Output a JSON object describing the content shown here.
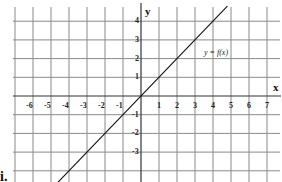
{
  "chart_data": {
    "type": "line",
    "title": "",
    "xlabel": "x",
    "ylabel": "y",
    "xlim": [
      -7,
      7
    ],
    "ylim": [
      -4,
      4.8
    ],
    "grid": true,
    "x_ticks": [
      "-6",
      "-5",
      "-4",
      "-3",
      "-2",
      "-1",
      "1",
      "2",
      "3",
      "4",
      "5",
      "6",
      "7"
    ],
    "y_ticks": [
      "4",
      "3",
      "2",
      "1",
      "-1",
      "-2",
      "-3"
    ],
    "series": [
      {
        "name": "y = f(x)",
        "x": [
          -4,
          -3,
          -2,
          -1,
          0,
          1,
          2,
          3,
          4,
          4.8
        ],
        "y": [
          -4,
          -3,
          -2,
          -1,
          0,
          1,
          2,
          3,
          4,
          4.8
        ]
      }
    ],
    "annotations": [
      {
        "text": "y = f(x)",
        "x": 3.3,
        "y": 2.3
      }
    ]
  },
  "labels": {
    "part": "i.",
    "x_axis": "x",
    "y_axis": "y",
    "function": "y = f(x)"
  }
}
